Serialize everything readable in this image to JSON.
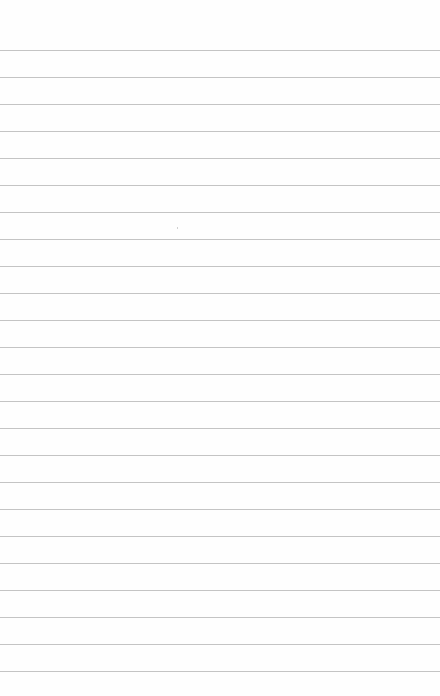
{
  "page": {
    "type": "lined-paper",
    "background": "#fefefe",
    "line_color": "#c4c4c4",
    "line_count": 24,
    "first_line_y": 50,
    "line_spacing": 27
  }
}
